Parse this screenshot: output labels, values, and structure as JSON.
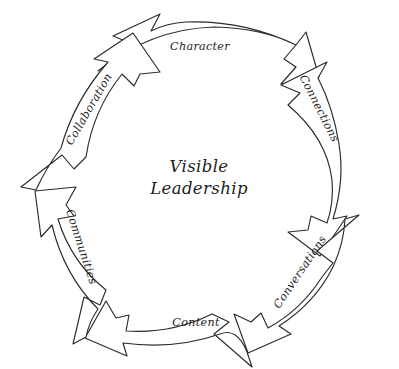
{
  "diagram": {
    "title": "Visible Leadership",
    "type": "cyclic-arrow-diagram",
    "style": "hand-drawn sketch, black ink on white",
    "center": {
      "line1": "Visible",
      "line2": "Leadership"
    },
    "background_color": "#ffffff",
    "ink_color": "#2b2b2b",
    "arrow_direction": "counterclockwise",
    "segments": [
      {
        "label": "Character",
        "position": "top",
        "mid_angle_deg": -90
      },
      {
        "label": "Connections",
        "position": "upper-right",
        "mid_angle_deg": -30
      },
      {
        "label": "Conversations",
        "position": "lower-right",
        "mid_angle_deg": 30
      },
      {
        "label": "Content",
        "position": "bottom",
        "mid_angle_deg": 90
      },
      {
        "label": "Communities",
        "position": "lower-left",
        "mid_angle_deg": 150
      },
      {
        "label": "Collaboration",
        "position": "upper-left",
        "mid_angle_deg": -150
      }
    ]
  }
}
